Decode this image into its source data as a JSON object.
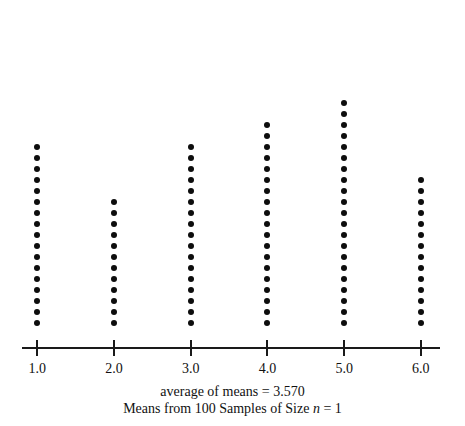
{
  "chart_data": {
    "type": "dotplot",
    "title": "",
    "xlabel": "",
    "ylabel": "",
    "categories": [
      "1.0",
      "2.0",
      "3.0",
      "4.0",
      "5.0",
      "6.0"
    ],
    "x": [
      1.0,
      2.0,
      3.0,
      4.0,
      5.0,
      6.0
    ],
    "values": [
      17,
      12,
      17,
      19,
      21,
      14
    ],
    "counts_note": "each dot represents one sample mean; dots are stacked vertically above each tick",
    "total_dots": 100,
    "xlim": [
      0.8,
      6.25
    ],
    "grid": false,
    "legend": false,
    "tick_labels": [
      "1.0",
      "2.0",
      "3.0",
      "4.0",
      "5.0",
      "6.0"
    ],
    "series": [
      {
        "name": "Means from 100 Samples of Size n = 1",
        "values": [
          17,
          12,
          17,
          19,
          21,
          14
        ]
      }
    ],
    "annotations": [
      "average of means = 3.570",
      "Means from 100 Samples of Size n = 1"
    ],
    "average_of_means": 3.57
  },
  "axis": {
    "ticks": [
      {
        "label": "1.0",
        "value": 1.0
      },
      {
        "label": "2.0",
        "value": 2.0
      },
      {
        "label": "3.0",
        "value": 3.0
      },
      {
        "label": "4.0",
        "value": 4.0
      },
      {
        "label": "5.0",
        "value": 5.0
      },
      {
        "label": "6.0",
        "value": 6.0
      }
    ]
  },
  "caption": {
    "line1_prefix": "average of means = ",
    "line1_value": "3.570",
    "line2_prefix": "Means from 100 Samples of Size ",
    "line2_italic": "n",
    "line2_suffix": " = 1"
  },
  "colors": {
    "dot": "#0d0d0d",
    "axis": "#1a1a1a",
    "text": "#111111",
    "background": "#ffffff"
  }
}
